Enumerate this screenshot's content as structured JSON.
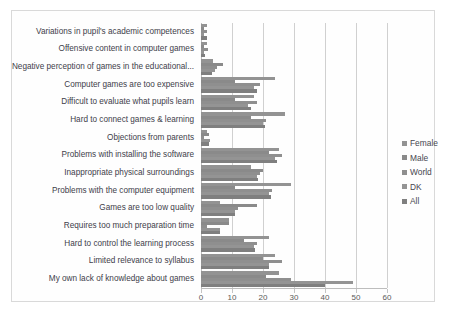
{
  "chart_data": {
    "type": "bar",
    "orientation": "horizontal",
    "title": "",
    "xlabel": "",
    "ylabel": "",
    "xlim": [
      0,
      60
    ],
    "xticks": [
      0,
      10,
      20,
      30,
      40,
      50,
      60
    ],
    "grid": true,
    "legend_position": "right",
    "categories": [
      "Variations in pupil's academic competences",
      "Offensive content in computer games",
      "Negative perception of games in the educational...",
      "Computer games are too expensive",
      "Difficult to evaluate what pupils learn",
      "Hard to connect games & learning",
      "Objections from parents",
      "Problems with installing the software",
      "Inappropriate physical surroundings",
      "Problems with the computer equipment",
      "Games are too low quality",
      "Requires too much preparation time",
      "Hard to control the learning process",
      "Limited relevance to syllabus",
      "My own lack of knowledge about  games"
    ],
    "series": [
      {
        "name": "Female",
        "color": "#939393",
        "values": [
          2.0,
          1.8,
          4.0,
          24.0,
          17.0,
          27.0,
          2.0,
          25.0,
          16.0,
          29.0,
          6.0,
          9.0,
          22.0,
          24.0,
          25.0
        ]
      },
      {
        "name": "Male",
        "color": "#8a8a8a",
        "values": [
          1.0,
          1.0,
          7.0,
          11.0,
          11.0,
          16.0,
          2.5,
          22.0,
          20.0,
          11.0,
          18.0,
          9.0,
          14.0,
          20.0,
          21.0
        ]
      },
      {
        "name": "World",
        "color": "#8f8f8f",
        "values": [
          2.0,
          2.2,
          5.0,
          19.0,
          18.0,
          21.0,
          1.0,
          26.0,
          19.0,
          23.0,
          12.0,
          2.0,
          18.0,
          26.0,
          29.0
        ]
      },
      {
        "name": "DK",
        "color": "#949494",
        "values": [
          1.0,
          1.0,
          4.5,
          17.0,
          15.0,
          20.0,
          3.0,
          24.0,
          18.0,
          22.0,
          11.0,
          6.0,
          17.0,
          22.0,
          49.0
        ]
      },
      {
        "name": "All",
        "color": "#7f7f7f",
        "values": [
          2.0,
          1.2,
          3.5,
          18.0,
          16.0,
          20.5,
          2.5,
          24.5,
          18.5,
          22.5,
          11.0,
          6.0,
          17.5,
          22.0,
          40.0
        ]
      }
    ]
  },
  "legend": {
    "items": [
      {
        "label": "Female"
      },
      {
        "label": "Male"
      },
      {
        "label": "World"
      },
      {
        "label": "DK"
      },
      {
        "label": "All"
      }
    ]
  },
  "caption": {
    "text": ""
  }
}
